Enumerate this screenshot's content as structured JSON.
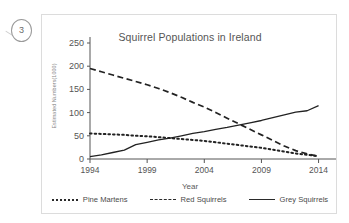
{
  "annotation": {
    "number": "3"
  },
  "chart_data": {
    "type": "line",
    "title": "Squirrel Populations in Ireland",
    "xlabel": "Year",
    "ylabel": "Estimated Numbers(1000)",
    "xlim": [
      1994,
      2015
    ],
    "ylim": [
      0,
      250
    ],
    "yticks": [
      0,
      50,
      100,
      150,
      200,
      250
    ],
    "xticks": [
      1994,
      1999,
      2004,
      2009,
      2014
    ],
    "xtick_labels": [
      "1994",
      "1999",
      "2004",
      "2009",
      "2014"
    ],
    "ytick_labels": [
      "0",
      "50",
      "100",
      "150",
      "200",
      "250"
    ],
    "grid": false,
    "legend_position": "bottom",
    "x": [
      1994,
      1995,
      1996,
      1997,
      1998,
      1999,
      2000,
      2001,
      2002,
      2003,
      2004,
      2005,
      2006,
      2007,
      2008,
      2009,
      2010,
      2011,
      2012,
      2013,
      2014
    ],
    "series": [
      {
        "name": "Pine Martens",
        "style": "dotted",
        "color": "#222222",
        "values": [
          55,
          54,
          53,
          52,
          50,
          49,
          47,
          45,
          43,
          41,
          39,
          36,
          33,
          30,
          27,
          24,
          20,
          16,
          12,
          9,
          6
        ]
      },
      {
        "name": "Red Squirrels",
        "style": "dashed",
        "color": "#222222",
        "values": [
          195,
          188,
          181,
          174,
          167,
          160,
          152,
          143,
          133,
          122,
          112,
          100,
          88,
          76,
          64,
          52,
          40,
          28,
          18,
          11,
          6
        ]
      },
      {
        "name": "Grey Squirrels",
        "style": "solid",
        "color": "#222222",
        "values": [
          5,
          9,
          14,
          19,
          31,
          36,
          41,
          45,
          50,
          55,
          59,
          64,
          68,
          73,
          78,
          83,
          89,
          95,
          101,
          104,
          115
        ]
      }
    ]
  }
}
